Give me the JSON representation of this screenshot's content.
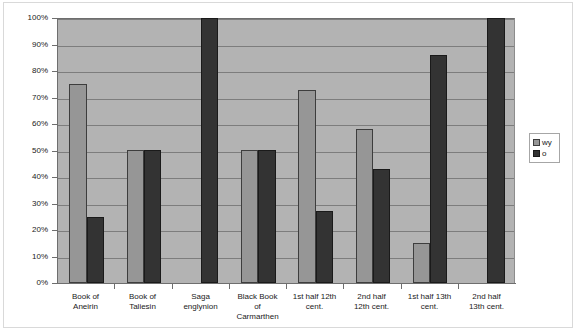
{
  "chart_data": {
    "type": "bar",
    "title": "",
    "xlabel": "",
    "ylabel": "",
    "ylim": [
      0,
      100
    ],
    "y_tick_labels": [
      "0%",
      "10%",
      "20%",
      "30%",
      "40%",
      "50%",
      "60%",
      "70%",
      "80%",
      "90%",
      "100%"
    ],
    "y_tick_values": [
      0,
      10,
      20,
      30,
      40,
      50,
      60,
      70,
      80,
      90,
      100
    ],
    "grid": true,
    "legend_position": "right",
    "categories": [
      "Book of Aneirin",
      "Book of Taliesin",
      "Saga englynion",
      "Black Book of Carmarthen",
      "1st half 12th cent.",
      "2nd half 12th cent.",
      "1st half 13th cent.",
      "2nd half 13th cent."
    ],
    "category_lines": [
      [
        "Book of",
        "Aneirin"
      ],
      [
        "Book of",
        "Taliesin"
      ],
      [
        "Saga",
        "englynion"
      ],
      [
        "Black Book",
        "of",
        "Carmarthen"
      ],
      [
        "1st half 12th",
        "cent."
      ],
      [
        "2nd half",
        "12th cent."
      ],
      [
        "1st half 13th",
        "cent."
      ],
      [
        "2nd half",
        "13th cent."
      ]
    ],
    "series": [
      {
        "name": "wy",
        "color": "#969696",
        "values": [
          75,
          50,
          0,
          50,
          73,
          58,
          15,
          0
        ]
      },
      {
        "name": "o",
        "color": "#333333",
        "values": [
          25,
          50,
          100,
          50,
          27,
          43,
          86,
          100
        ]
      }
    ]
  },
  "legend": {
    "entries": [
      {
        "label": "wy"
      },
      {
        "label": "o"
      }
    ]
  },
  "colors": {
    "plot_background": "#b3b3b3",
    "gridline": "#7d7d7d",
    "axis": "#6e6e6e",
    "series_wy": "#969696",
    "series_o": "#333333",
    "page_background": "#ffffff",
    "frame": "#d9d9d9"
  }
}
